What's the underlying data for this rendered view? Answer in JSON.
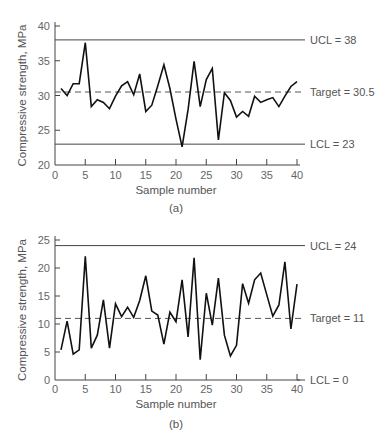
{
  "chart_data": [
    {
      "type": "line",
      "panel": "(a)",
      "xlabel": "Sample number",
      "ylabel": "Compressive strength, MPa",
      "xlim": [
        0,
        40
      ],
      "ylim": [
        20,
        40
      ],
      "xticks": [
        0,
        5,
        10,
        15,
        20,
        25,
        30,
        35,
        40
      ],
      "yticks": [
        20,
        25,
        30,
        35,
        40
      ],
      "grid": false,
      "control_lines": [
        {
          "name": "UCL",
          "value": 38,
          "label": "UCL = 38",
          "style": "solid"
        },
        {
          "name": "Target",
          "value": 30.5,
          "label": "Target = 30.5",
          "style": "dashed"
        },
        {
          "name": "LCL",
          "value": 23,
          "label": "LCL = 23",
          "style": "solid"
        }
      ],
      "x": [
        1,
        2,
        3,
        4,
        5,
        6,
        7,
        8,
        9,
        10,
        11,
        12,
        13,
        14,
        15,
        16,
        17,
        18,
        19,
        20,
        21,
        22,
        23,
        24,
        25,
        26,
        27,
        28,
        29,
        30,
        31,
        32,
        33,
        34,
        35,
        36,
        37,
        38,
        39,
        40
      ],
      "values": [
        31.0,
        30.0,
        31.7,
        31.7,
        37.6,
        28.4,
        29.4,
        29.0,
        28.1,
        29.9,
        31.4,
        32.0,
        30.1,
        33.1,
        27.7,
        28.6,
        31.4,
        34.4,
        31.0,
        26.6,
        22.6,
        28.0,
        34.9,
        28.4,
        32.3,
        33.9,
        23.6,
        30.4,
        29.3,
        26.9,
        27.7,
        27.0,
        29.9,
        29.0,
        29.4,
        29.7,
        28.4,
        29.9,
        31.3,
        32.0
      ]
    },
    {
      "type": "line",
      "panel": "(b)",
      "xlabel": "Sample number",
      "ylabel": "Compressive strength, MPa",
      "xlim": [
        0,
        40
      ],
      "ylim": [
        0,
        25
      ],
      "xticks": [
        0,
        5,
        10,
        15,
        20,
        25,
        30,
        35,
        40
      ],
      "yticks": [
        0,
        5,
        10,
        15,
        20,
        25
      ],
      "grid": false,
      "control_lines": [
        {
          "name": "UCL",
          "value": 24,
          "label": "UCL = 24",
          "style": "solid"
        },
        {
          "name": "Target",
          "value": 11,
          "label": "Target = 11",
          "style": "dashed"
        },
        {
          "name": "LCL",
          "value": 0,
          "label": "LCL = 0",
          "style": "solid"
        }
      ],
      "x": [
        1,
        2,
        3,
        4,
        5,
        6,
        7,
        8,
        9,
        10,
        11,
        12,
        13,
        14,
        15,
        16,
        17,
        18,
        19,
        20,
        21,
        22,
        23,
        24,
        25,
        26,
        27,
        28,
        29,
        30,
        31,
        32,
        33,
        34,
        35,
        36,
        37,
        38,
        39,
        40
      ],
      "values": [
        5.4,
        10.5,
        4.6,
        5.4,
        22.1,
        5.7,
        8.0,
        14.3,
        5.7,
        13.6,
        11.3,
        13.0,
        11.2,
        14.2,
        18.6,
        12.3,
        11.6,
        6.4,
        12.1,
        10.4,
        17.9,
        7.7,
        21.8,
        3.6,
        15.5,
        9.8,
        18.2,
        8.0,
        4.3,
        6.2,
        17.2,
        13.7,
        17.9,
        19.1,
        15.2,
        11.4,
        13.4,
        21.1,
        9.1,
        17.1
      ]
    }
  ],
  "labels": {
    "panel_a": "(a)",
    "panel_b": "(b)",
    "xlabel": "Sample number",
    "ylabel": "Compressive strength, MPa"
  }
}
